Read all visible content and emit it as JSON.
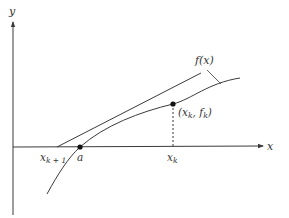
{
  "figure": {
    "colors": {
      "line": "#3a3a3a",
      "background": "#ffffff",
      "text": "#333333"
    }
  },
  "axes": {
    "x_label": "x",
    "y_label": "y"
  },
  "curve": {
    "label": "f(x)"
  },
  "points": {
    "root": {
      "label": "a"
    },
    "current": {
      "label": "(x",
      "sub": "k",
      "mid": ", f",
      "sub2": "k",
      "close": ")"
    },
    "xk": {
      "label": "x",
      "sub": "k"
    },
    "xk1": {
      "label": "x",
      "sub": "k + 1"
    }
  }
}
